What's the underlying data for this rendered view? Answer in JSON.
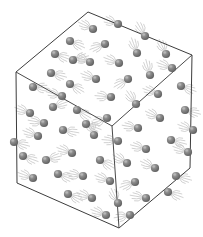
{
  "figure": {
    "background_color": "#ffffff",
    "width": 203,
    "height": 237
  },
  "container": {
    "name": "cube",
    "shape": "cube",
    "projection": "isometric",
    "edge_color": "#3c3c3c",
    "edge_width": 1,
    "fill": "none",
    "vertices": {
      "top": [
        88,
        12
      ],
      "upper_right": [
        192,
        55
      ],
      "right": [
        190,
        168
      ],
      "bottom": [
        119,
        228
      ],
      "lower_left": [
        17,
        183
      ],
      "left": [
        16,
        72
      ],
      "center": [
        112,
        126
      ]
    },
    "outline_path": "M 88 12 L 192 55 L 190 168 L 119 228 L 17 183 L 16 72 Z",
    "inner_edges": [
      "M 16 72 L 112 126",
      "M 192 55 L 112 126",
      "M 119 228 L 112 126"
    ],
    "faces": [
      {
        "name": "top-face",
        "path": "M 88 12 L 192 55 L 112 126 L 16 72 Z"
      },
      {
        "name": "left-face",
        "path": "M 16 72 L 112 126 L 119 228 L 17 183 Z"
      },
      {
        "name": "right-face",
        "path": "M 112 126 L 192 55 L 190 168 L 119 228 Z"
      }
    ]
  },
  "particles": {
    "name": "gas-particles",
    "count": 60,
    "radius": 4.1,
    "body_color": "#6e6e6e",
    "shade_color": "#545454",
    "highlight_color": "#b9b9b9",
    "trail_color": "#c9c9c9",
    "trail_count_per_particle": 5,
    "trail_length": 12,
    "items": [
      {
        "x": 93,
        "y": 29,
        "angle": 205
      },
      {
        "x": 70,
        "y": 41,
        "angle": 25
      },
      {
        "x": 105,
        "y": 44,
        "angle": 160
      },
      {
        "x": 137,
        "y": 53,
        "angle": 250
      },
      {
        "x": 55,
        "y": 54,
        "angle": 20
      },
      {
        "x": 119,
        "y": 63,
        "angle": 200
      },
      {
        "x": 166,
        "y": 54,
        "angle": 245
      },
      {
        "x": 73,
        "y": 60,
        "angle": 345
      },
      {
        "x": 51,
        "y": 73,
        "angle": 15
      },
      {
        "x": 96,
        "y": 79,
        "angle": 200
      },
      {
        "x": 128,
        "y": 79,
        "angle": 150
      },
      {
        "x": 150,
        "y": 75,
        "angle": 255
      },
      {
        "x": 70,
        "y": 84,
        "angle": 30
      },
      {
        "x": 111,
        "y": 97,
        "angle": 185
      },
      {
        "x": 33,
        "y": 87,
        "angle": 5
      },
      {
        "x": 90,
        "y": 62,
        "angle": 200
      },
      {
        "x": 181,
        "y": 86,
        "angle": 20
      },
      {
        "x": 158,
        "y": 94,
        "angle": 200
      },
      {
        "x": 136,
        "y": 104,
        "angle": 235
      },
      {
        "x": 107,
        "y": 118,
        "angle": 160
      },
      {
        "x": 53,
        "y": 107,
        "angle": 340
      },
      {
        "x": 77,
        "y": 110,
        "angle": 30
      },
      {
        "x": 30,
        "y": 113,
        "angle": 200
      },
      {
        "x": 185,
        "y": 110,
        "angle": 15
      },
      {
        "x": 160,
        "y": 118,
        "angle": 205
      },
      {
        "x": 138,
        "y": 128,
        "angle": 190
      },
      {
        "x": 63,
        "y": 130,
        "angle": 10
      },
      {
        "x": 38,
        "y": 136,
        "angle": 200
      },
      {
        "x": 94,
        "y": 135,
        "angle": 250
      },
      {
        "x": 118,
        "y": 141,
        "angle": 185
      },
      {
        "x": 23,
        "y": 156,
        "angle": 20
      },
      {
        "x": 46,
        "y": 160,
        "angle": 345
      },
      {
        "x": 72,
        "y": 153,
        "angle": 200
      },
      {
        "x": 146,
        "y": 149,
        "angle": 195
      },
      {
        "x": 171,
        "y": 140,
        "angle": 15
      },
      {
        "x": 188,
        "y": 152,
        "angle": 200
      },
      {
        "x": 100,
        "y": 160,
        "angle": 30
      },
      {
        "x": 127,
        "y": 163,
        "angle": 210
      },
      {
        "x": 33,
        "y": 178,
        "angle": 200
      },
      {
        "x": 58,
        "y": 174,
        "angle": 20
      },
      {
        "x": 83,
        "y": 176,
        "angle": 190
      },
      {
        "x": 155,
        "y": 168,
        "angle": 205
      },
      {
        "x": 176,
        "y": 176,
        "angle": 15
      },
      {
        "x": 110,
        "y": 181,
        "angle": 200
      },
      {
        "x": 135,
        "y": 182,
        "angle": 160
      },
      {
        "x": 68,
        "y": 194,
        "angle": 25
      },
      {
        "x": 92,
        "y": 198,
        "angle": 200
      },
      {
        "x": 146,
        "y": 198,
        "angle": 190
      },
      {
        "x": 168,
        "y": 192,
        "angle": 20
      },
      {
        "x": 118,
        "y": 203,
        "angle": 245
      },
      {
        "x": 106,
        "y": 215,
        "angle": 200
      },
      {
        "x": 130,
        "y": 215,
        "angle": 170
      },
      {
        "x": 44,
        "y": 123,
        "angle": 190
      },
      {
        "x": 86,
        "y": 124,
        "angle": 20
      },
      {
        "x": 172,
        "y": 68,
        "angle": 200
      },
      {
        "x": 145,
        "y": 36,
        "angle": 240
      },
      {
        "x": 118,
        "y": 24,
        "angle": 200
      },
      {
        "x": 62,
        "y": 96,
        "angle": 195
      },
      {
        "x": 193,
        "y": 130,
        "angle": 200
      },
      {
        "x": 14,
        "y": 142,
        "angle": 15
      }
    ]
  }
}
